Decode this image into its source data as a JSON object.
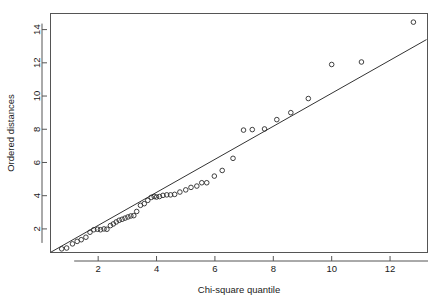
{
  "chart_data": {
    "type": "scatter",
    "title": "",
    "xlabel": "Chi-square quantile",
    "ylabel": "Ordered distances",
    "xlim": [
      0.35,
      13.3
    ],
    "ylim": [
      0.55,
      15.0
    ],
    "xticks": [
      2,
      4,
      6,
      8,
      10,
      12
    ],
    "xtick_labels": [
      "2",
      "4",
      "6",
      "8",
      "10",
      "12"
    ],
    "yticks": [
      2,
      4,
      6,
      8,
      10,
      12,
      14
    ],
    "ytick_labels": [
      "2",
      "4",
      "6",
      "8",
      "10",
      "12",
      "14"
    ],
    "grid": false,
    "legend": "none",
    "point_marker": "open-circle",
    "point_color": "#2b2b2b",
    "line_color": "#333333",
    "frame_color": "#555555",
    "background": "#ffffff",
    "reference_line": {
      "label": "1:1 reference line",
      "x": [
        0.38,
        13.25
      ],
      "y": [
        0.6,
        13.4
      ]
    },
    "series": [
      {
        "name": "Ordered distances vs Chi-square quantile",
        "points": [
          [
            0.75,
            0.8
          ],
          [
            0.92,
            0.85
          ],
          [
            1.12,
            1.1
          ],
          [
            1.28,
            1.25
          ],
          [
            1.42,
            1.35
          ],
          [
            1.58,
            1.5
          ],
          [
            1.72,
            1.8
          ],
          [
            1.85,
            1.95
          ],
          [
            1.98,
            1.98
          ],
          [
            2.08,
            1.95
          ],
          [
            2.2,
            2.0
          ],
          [
            2.3,
            1.98
          ],
          [
            2.42,
            2.2
          ],
          [
            2.52,
            2.3
          ],
          [
            2.62,
            2.42
          ],
          [
            2.72,
            2.52
          ],
          [
            2.82,
            2.58
          ],
          [
            2.92,
            2.65
          ],
          [
            3.02,
            2.72
          ],
          [
            3.12,
            2.78
          ],
          [
            3.22,
            2.8
          ],
          [
            3.32,
            3.05
          ],
          [
            3.45,
            3.42
          ],
          [
            3.58,
            3.52
          ],
          [
            3.7,
            3.72
          ],
          [
            3.82,
            3.9
          ],
          [
            3.92,
            3.95
          ],
          [
            4.0,
            3.92
          ],
          [
            4.1,
            3.95
          ],
          [
            4.22,
            4.02
          ],
          [
            4.35,
            4.05
          ],
          [
            4.48,
            4.05
          ],
          [
            4.62,
            4.08
          ],
          [
            4.8,
            4.22
          ],
          [
            5.0,
            4.35
          ],
          [
            5.18,
            4.5
          ],
          [
            5.38,
            4.58
          ],
          [
            5.55,
            4.78
          ],
          [
            5.72,
            4.78
          ],
          [
            5.98,
            5.18
          ],
          [
            6.25,
            5.52
          ],
          [
            6.62,
            6.25
          ],
          [
            6.98,
            7.95
          ],
          [
            7.28,
            7.98
          ],
          [
            7.7,
            8.02
          ],
          [
            8.12,
            8.58
          ],
          [
            8.6,
            9.0
          ],
          [
            9.2,
            9.85
          ],
          [
            10.0,
            11.9
          ],
          [
            11.02,
            12.05
          ],
          [
            12.8,
            14.45
          ]
        ]
      }
    ]
  },
  "layout": {
    "plot_left": 50,
    "plot_right": 428,
    "plot_top": 13,
    "plot_bottom": 253,
    "x_axis_line_y": 261,
    "y_axis_line_x": 42
  }
}
